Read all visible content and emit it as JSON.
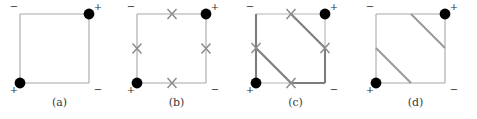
{
  "figure": {
    "kind": "four-panel-diagram",
    "panel_count": 4,
    "background_color": "#ffffff",
    "edge_color_light": "#a8a8a8",
    "edge_color_dark": "#7a7a7a",
    "marker_color": "#000000",
    "x_mark_color": "#8c8c8c",
    "square": {
      "x": 20,
      "y": 14,
      "size": 69
    },
    "panel_offsets": [
      0,
      117,
      236,
      356
    ]
  },
  "panels": [
    {
      "id": "a",
      "caption": "(a)",
      "corner_signs": {
        "top_left": "−",
        "top_right": "+",
        "bottom_left": "+",
        "bottom_right": "−"
      },
      "dots": [
        "top-right",
        "bottom-left"
      ],
      "x_marks": [],
      "diagonals": [],
      "dark_edges": []
    },
    {
      "id": "b",
      "caption": "(b)",
      "corner_signs": {
        "top_left": "−",
        "top_right": "+",
        "bottom_left": "+",
        "bottom_right": "−"
      },
      "dots": [
        "top-right",
        "bottom-left"
      ],
      "x_marks": [
        "top-mid",
        "right-mid",
        "bottom-mid",
        "left-mid"
      ],
      "diagonals": [],
      "dark_edges": []
    },
    {
      "id": "c",
      "caption": "(c)",
      "corner_signs": {
        "top_left": "−",
        "top_right": "+",
        "bottom_left": "+",
        "bottom_right": "−"
      },
      "dots": [
        "top-right",
        "bottom-left"
      ],
      "x_marks": [
        "top-mid",
        "right-mid",
        "bottom-mid",
        "left-mid"
      ],
      "diagonals": [
        {
          "from": "top-mid",
          "to": "right-mid",
          "style": "dark"
        },
        {
          "from": "left-mid",
          "to": "bottom-mid",
          "style": "dark"
        }
      ],
      "dark_edges": [
        "left-full",
        "right-lower",
        "bottom-right"
      ]
    },
    {
      "id": "d",
      "caption": "(d)",
      "corner_signs": {
        "top_left": "−",
        "top_right": "+",
        "bottom_left": "+",
        "bottom_right": "−"
      },
      "dots": [
        "top-right",
        "bottom-left"
      ],
      "x_marks": [],
      "diagonals": [
        {
          "from": "top-mid",
          "to": "right-mid",
          "style": "light"
        },
        {
          "from": "left-mid",
          "to": "bottom-mid",
          "style": "light"
        }
      ],
      "dark_edges": []
    }
  ]
}
